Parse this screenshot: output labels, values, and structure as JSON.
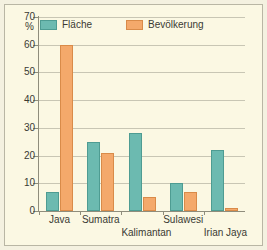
{
  "chart_data": {
    "type": "bar",
    "title": "",
    "subtitle": "",
    "xlabel": "",
    "ylabel": "%",
    "ylim": [
      0,
      70
    ],
    "ytick_step": 10,
    "yticks": [
      0,
      10,
      20,
      30,
      40,
      50,
      60,
      70
    ],
    "ytick_labels": [
      "0",
      "10",
      "20",
      "30",
      "40",
      "50",
      "60",
      "70"
    ],
    "grid": true,
    "grid_axis": "y",
    "legend_position": "top-left-inside",
    "categories": [
      "Java",
      "Sumatra",
      "Kalimantan",
      "Sulawesi",
      "Irian Jaya"
    ],
    "series": [
      {
        "name": "Fläche",
        "color": "#6cbab0",
        "values": [
          7,
          25,
          28,
          10,
          22
        ]
      },
      {
        "name": "Bevölkerung",
        "color": "#f4a96b",
        "values": [
          60,
          21,
          5,
          7,
          1
        ]
      }
    ],
    "annotations": []
  },
  "axis": {
    "unit_label": "%",
    "ytick_labels": [
      "70",
      "60",
      "50",
      "40",
      "30",
      "20",
      "10",
      "0"
    ]
  },
  "legend": {
    "items": [
      {
        "label": "Fläche",
        "swatch": "teal-swatch"
      },
      {
        "label": "Bevölkerung",
        "swatch": "orange-swatch"
      }
    ]
  },
  "xaxis": {
    "labels": [
      "Java",
      "Sumatra",
      "Kalimantan",
      "Sulawesi",
      "Irian Jaya"
    ]
  },
  "colors": {
    "series_flaeche": "#6cbab0",
    "series_bevoelkerung": "#f4a96b",
    "plot_background": "#fbf8e3",
    "frame": "#b9b6a4",
    "grid": "#c8c6b4",
    "text": "#3a3a33"
  }
}
